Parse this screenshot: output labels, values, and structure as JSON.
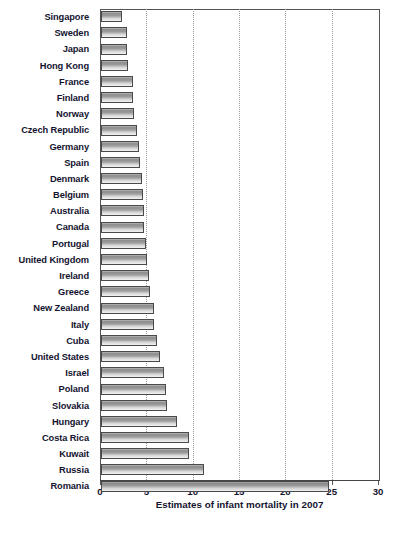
{
  "chart_data": {
    "type": "bar",
    "orientation": "horizontal",
    "title": "",
    "subtitle": "",
    "xlabel": "Estimates of infant mortality in 2007",
    "ylabel": "",
    "xlim": [
      0,
      30
    ],
    "xticks": [
      0,
      5,
      10,
      15,
      20,
      25,
      30
    ],
    "xtick_labels": [
      "0",
      "5",
      "10",
      "15",
      "20",
      "25",
      "30"
    ],
    "grid": "vertical-dotted",
    "legend": "none",
    "categories": [
      "Singapore",
      "Sweden",
      "Japan",
      "Hong Kong",
      "France",
      "Finland",
      "Norway",
      "Czech Republic",
      "Germany",
      "Spain",
      "Denmark",
      "Belgium",
      "Australia",
      "Canada",
      "Portugal",
      "United Kingdom",
      "Ireland",
      "Greece",
      "New Zealand",
      "Italy",
      "Cuba",
      "United States",
      "Israel",
      "Poland",
      "Slovakia",
      "Hungary",
      "Costa Rica",
      "Kuwait",
      "Russia",
      "Romania"
    ],
    "values": [
      2.3,
      2.8,
      2.8,
      2.9,
      3.4,
      3.5,
      3.6,
      3.9,
      4.1,
      4.2,
      4.4,
      4.5,
      4.6,
      4.6,
      4.9,
      5.0,
      5.2,
      5.3,
      5.7,
      5.7,
      6.0,
      6.4,
      6.8,
      7.0,
      7.1,
      8.2,
      9.5,
      9.5,
      11.1,
      24.6
    ]
  },
  "axis": {
    "x_title": "Estimates of infant mortality in 2007"
  },
  "colors": {
    "bar_face_light": "#f2f2f2",
    "bar_face_dark": "#8e8e8e",
    "bar_border": "#4a4a4a",
    "gridline": "#9a9a9a",
    "axis": "#555555",
    "text": "#141430",
    "background": "#ffffff"
  }
}
